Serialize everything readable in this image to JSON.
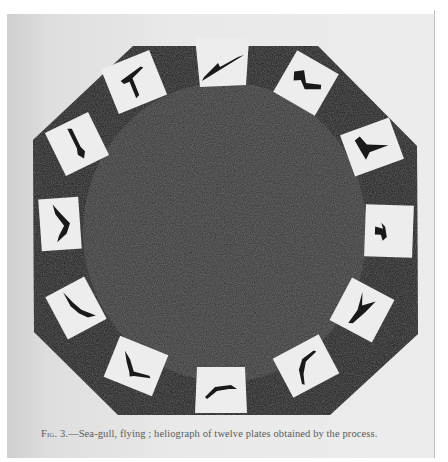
{
  "page": {
    "background_color": "#e8e8e8",
    "ink_color": "#2a2a2a"
  },
  "figure": {
    "shape": "octagon",
    "plate_count": 12,
    "plates": [
      {
        "index": 1,
        "position": "top",
        "subject": "sea-gull wings spread diagonal"
      },
      {
        "index": 2,
        "position": "upper-right",
        "subject": "sea-gull wings raised"
      },
      {
        "index": 3,
        "position": "right-upper",
        "subject": "sea-gull wings up V"
      },
      {
        "index": 4,
        "position": "right",
        "subject": "sea-gull small silhouette"
      },
      {
        "index": 5,
        "position": "right-lower",
        "subject": "sea-gull wings up Y"
      },
      {
        "index": 6,
        "position": "lower-right",
        "subject": "sea-gull wings arched"
      },
      {
        "index": 7,
        "position": "bottom",
        "subject": "sea-gull wings arched down"
      },
      {
        "index": 8,
        "position": "lower-left",
        "subject": "sea-gull wings extended"
      },
      {
        "index": 9,
        "position": "left-lower",
        "subject": "sea-gull wings diagonal"
      },
      {
        "index": 10,
        "position": "left",
        "subject": "sea-gull wings curved"
      },
      {
        "index": 11,
        "position": "left-upper",
        "subject": "sea-gull wings down"
      },
      {
        "index": 12,
        "position": "upper-left",
        "subject": "sea-gull wings T-shape"
      }
    ]
  },
  "caption": {
    "label": "Fig. 3.",
    "dash": "—",
    "text": "Sea-gull, flying ; heliograph of twelve plates obtained by the process."
  }
}
